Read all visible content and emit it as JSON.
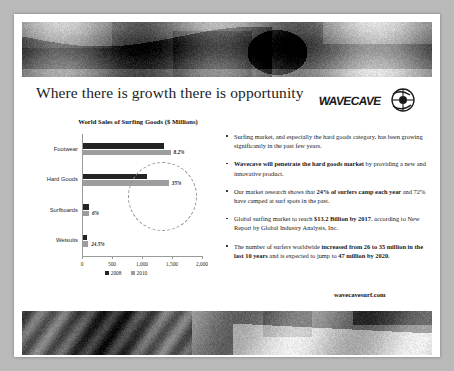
{
  "slide": {
    "title": "Where there is growth there is opportunity",
    "logo_text": "WAVECAVE",
    "logo_name": "wavecave-logo",
    "footer_url": "wavecavesurf.com",
    "top_photo_alt": "surfer-loading-board-on-car-photo",
    "bottom_photo_alt": "surfboard-and-palm-fronds-photo"
  },
  "chart_data": {
    "type": "bar",
    "orientation": "horizontal",
    "title": "World Sales of Surfing Goods ($ Millions)",
    "categories": [
      "Footwear",
      "Hard Goods",
      "Surfboards",
      "Wetsuits"
    ],
    "series": [
      {
        "name": "2008",
        "color": "#232323",
        "values": [
          1350,
          1060,
          95,
          70
        ]
      },
      {
        "name": "2010",
        "color": "#9d9d9d",
        "values": [
          1460,
          1430,
          100,
          87
        ]
      }
    ],
    "growth_labels": [
      "8.2%",
      "35%",
      "6%",
      "24.5%"
    ],
    "xlabel": "",
    "ylabel": "",
    "xlim": [
      0,
      2000
    ],
    "xticks": [
      0,
      500,
      1000,
      1500,
      2000
    ],
    "xticklabels": [
      "0",
      "500",
      "1,000",
      "1,500",
      "2,000"
    ],
    "grid": false,
    "legend_position": "bottom",
    "annotation": "dashed-ellipse-highlight-hard-goods"
  },
  "bullets": [
    {
      "id": "bullet-market-growth",
      "parts": [
        {
          "text": "Surfing market, and especially the hard goods category, has been growing significantly in the past few years.",
          "bold": false
        }
      ]
    },
    {
      "id": "bullet-wavecave-penetrate",
      "parts": [
        {
          "text": "Wavecave will penetrate the hard goods market",
          "bold": true
        },
        {
          "text": " by providing a new and innovative product.",
          "bold": false
        }
      ]
    },
    {
      "id": "bullet-market-research",
      "parts": [
        {
          "text": "Our market research shows that ",
          "bold": false
        },
        {
          "text": "24% of surfers camp each year",
          "bold": true
        },
        {
          "text": " and 72% have camped at surf spots in the past.",
          "bold": false
        }
      ]
    },
    {
      "id": "bullet-global-market",
      "parts": [
        {
          "text": "Global surfing market to reach ",
          "bold": false
        },
        {
          "text": "$13.2 Billion by 2017",
          "bold": true
        },
        {
          "text": ", according to New Report by Global Industry Analysts, Inc.",
          "bold": false
        }
      ]
    },
    {
      "id": "bullet-surfer-count",
      "parts": [
        {
          "text": "The number of surfers worldwide ",
          "bold": false
        },
        {
          "text": "increased from 26 to 35 million in the last 10 years",
          "bold": true
        },
        {
          "text": " and is expected to jump to ",
          "bold": false
        },
        {
          "text": "47 million by 2020.",
          "bold": true
        }
      ]
    }
  ]
}
